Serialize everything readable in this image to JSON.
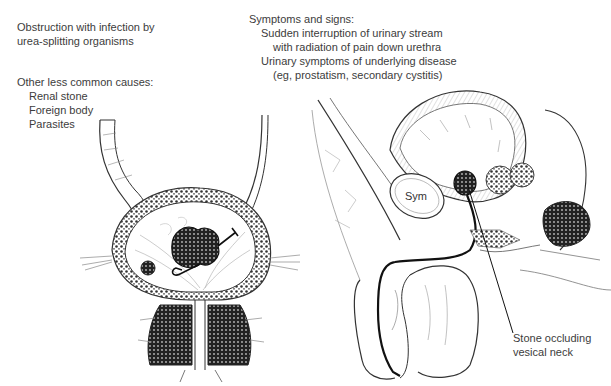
{
  "left_notes": {
    "cause_main": [
      "Obstruction with infection by",
      "urea-splitting organisms"
    ],
    "other_heading": "Other less common causes:",
    "other_items": [
      "Renal stone",
      "Foreign body",
      "Parasites"
    ]
  },
  "right_notes": {
    "heading": "Symptoms and signs:",
    "lines": [
      "Sudden interruption of urinary stream",
      "with radiation of pain down urethra",
      "Urinary symptoms of underlying disease",
      "(eg, prostatism, secondary cystitis)"
    ]
  },
  "figure_labels": {
    "symphysis": "Sym",
    "callout": [
      "Stone occluding",
      "vesical neck"
    ]
  }
}
